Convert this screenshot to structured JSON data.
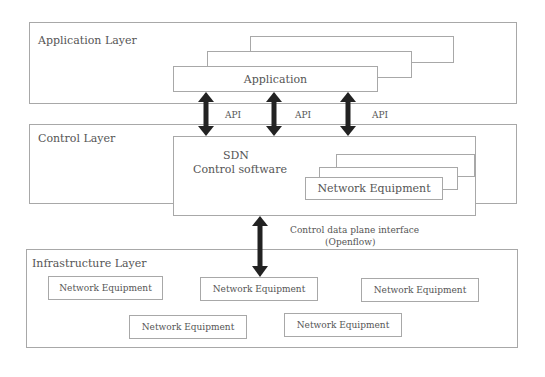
{
  "diagram": {
    "layers": {
      "application": {
        "label": "Application Layer",
        "app_box_label": "Application"
      },
      "control": {
        "label": "Control Layer",
        "controller_title": "SDN",
        "controller_subtitle": "Control software",
        "network_equipment_label": "Network Equipment"
      },
      "infrastructure": {
        "label": "Infrastructure Layer",
        "devices": [
          {
            "label": "Network Equipment"
          },
          {
            "label": "Network Equipment"
          },
          {
            "label": "Network Equipment"
          },
          {
            "label": "Network Equipment"
          },
          {
            "label": "Network Equipment"
          }
        ]
      }
    },
    "connections": {
      "api_labels": [
        "API",
        "API",
        "API"
      ],
      "southbound_label_line1": "Control data plane interface",
      "southbound_label_line2": "(Openflow)"
    },
    "colors": {
      "border": "#a8a8a8",
      "arrow": "#222222",
      "text": "#555555"
    }
  }
}
